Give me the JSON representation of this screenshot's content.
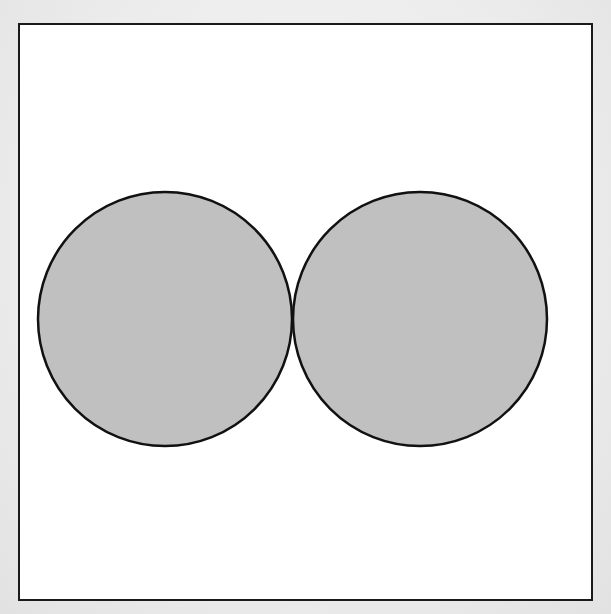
{
  "diagram": {
    "frame": {
      "x": 18,
      "y": 23,
      "width": 575,
      "height": 578,
      "stroke": "#1a1a1a"
    },
    "shapes": [
      {
        "type": "circle",
        "id": "left-circle",
        "cx": 165,
        "cy": 319,
        "r": 127,
        "fill": "#c0c0c0",
        "stroke": "#111111"
      },
      {
        "type": "circle",
        "id": "right-circle",
        "cx": 420,
        "cy": 319,
        "r": 127,
        "fill": "#c0c0c0",
        "stroke": "#111111"
      }
    ],
    "tangent_point": {
      "x": 292,
      "y": 319
    }
  }
}
